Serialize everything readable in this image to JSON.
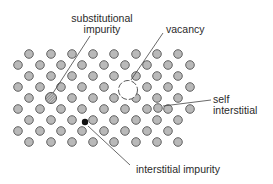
{
  "diagram": {
    "colors": {
      "atom_fill": "#b9b9b9",
      "atom_stroke": "#555555",
      "line": "#444444",
      "interstitial_impurity": "#111111",
      "substitutional_fill": "#9a9a9a"
    },
    "lattice": {
      "row_y": [
        54,
        65,
        76,
        87,
        98,
        109,
        120,
        131,
        142
      ],
      "even_row_x": [
        29,
        51,
        72,
        93,
        114,
        136,
        157,
        178
      ],
      "odd_row_x": [
        18,
        40,
        61,
        82,
        104,
        125,
        147,
        168,
        190
      ],
      "atom_radius": 4.3,
      "omitted": [
        [
          128,
          87
        ],
        [
          125,
          87
        ],
        [
          51,
          98
        ],
        [
          136,
          98
        ],
        [
          114,
          98
        ]
      ]
    },
    "defects": {
      "substitutional_impurity": {
        "x": 51,
        "y": 98,
        "r": 5.5
      },
      "vacancy": {
        "x": 128,
        "y": 90,
        "r": 9.5
      },
      "interstitial_impurity": {
        "x": 85,
        "y": 122,
        "r": 3.2
      },
      "self_interstitial": {
        "x": 158,
        "y": 108,
        "r": 4.3
      }
    },
    "labels": {
      "substitutional_line1": "substitutional",
      "substitutional_line2": "impurity",
      "vacancy": "vacancy",
      "self_line1": "self",
      "self_line2": "interstitial",
      "interstitial_impurity": "interstitial impurity"
    },
    "leaders": {
      "substitutional": {
        "x1": 90,
        "y1": 36,
        "x2": 53,
        "y2": 93
      },
      "vacancy": {
        "x1": 163,
        "y1": 33,
        "x2": 131,
        "y2": 80
      },
      "self": {
        "x1": 211,
        "y1": 100,
        "x2": 163,
        "y2": 106
      },
      "interstitial": {
        "x1": 88,
        "y1": 126,
        "x2": 130,
        "y2": 165
      }
    }
  }
}
